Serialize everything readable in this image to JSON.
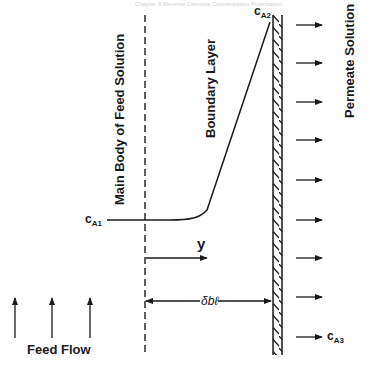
{
  "header": {
    "faint_text": "Chapter 8 Reverse Osmosis Concentration Polarization"
  },
  "regions": {
    "bulk": "Main Body of Feed Solution",
    "boundary": "Boundary Layer",
    "permeate": "Permeate Solution"
  },
  "labels": {
    "feed_flow": "Feed Flow",
    "y_axis": "y",
    "delta": "δbℓ",
    "c_a1": {
      "base": "c",
      "sub": "A1"
    },
    "c_a2": {
      "base": "c",
      "sub": "A2"
    },
    "c_a3": {
      "base": "c",
      "sub": "A3"
    }
  },
  "geometry": {
    "membrane_x": 273,
    "membrane_width": 9,
    "membrane_top": 15,
    "membrane_bottom": 355,
    "dashed_line_x": 145,
    "permeate_arrow_ys": [
      25,
      63,
      102,
      140,
      180,
      220,
      258,
      297,
      337
    ],
    "feed_arrow_xs": [
      15,
      52,
      90
    ]
  },
  "colors": {
    "ink": "#1a1a1a",
    "background": "#ffffff"
  }
}
